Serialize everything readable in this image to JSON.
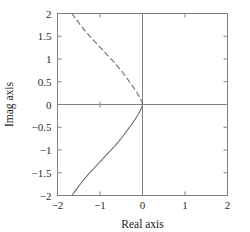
{
  "chart_data": {
    "type": "line",
    "title": "",
    "xlabel": "Real axis",
    "ylabel": "Imag axis",
    "xlim": [
      -2,
      2
    ],
    "ylim": [
      -2,
      2
    ],
    "grid": false,
    "legend": "none",
    "xticks": [
      -2,
      -1,
      0,
      1,
      2
    ],
    "xticklabels": [
      "−2",
      "−1",
      "0",
      "1",
      "2"
    ],
    "yticks": [
      -2,
      -1.5,
      -1,
      -0.5,
      0,
      0.5,
      1,
      1.5,
      2
    ],
    "yticklabels": [
      "−2",
      "−1.5",
      "−1",
      "−0.5",
      "0",
      "0.5",
      "1",
      "1.5",
      "2"
    ],
    "annotations": [
      {
        "name": "real-axis-line",
        "type": "axhline",
        "y": 0,
        "color": "#808080"
      },
      {
        "name": "imag-axis-line",
        "type": "axvline",
        "x": 0,
        "color": "#808080"
      },
      {
        "name": "interior-tick-marker",
        "type": "marker",
        "x": -1.0,
        "y": 0,
        "color": "#808080"
      }
    ],
    "series": [
      {
        "name": "branch-lower-solid",
        "style": "solid",
        "color": "#6e6e6e",
        "linewidth": 1.1,
        "x": [
          -1.66,
          -1.6,
          -1.52,
          -1.44,
          -1.35,
          -1.26,
          -1.16,
          -1.06,
          -0.96,
          -0.86,
          -0.76,
          -0.66,
          -0.57,
          -0.48,
          -0.4,
          -0.33,
          -0.26,
          -0.2,
          -0.15,
          -0.11,
          -0.08,
          -0.05,
          -0.03,
          -0.015,
          -0.005,
          0.0
        ],
        "y": [
          -2.0,
          -1.92,
          -1.82,
          -1.72,
          -1.62,
          -1.52,
          -1.42,
          -1.32,
          -1.22,
          -1.12,
          -1.02,
          -0.92,
          -0.82,
          -0.72,
          -0.62,
          -0.53,
          -0.44,
          -0.36,
          -0.29,
          -0.23,
          -0.18,
          -0.13,
          -0.09,
          -0.055,
          -0.025,
          0.0
        ]
      },
      {
        "name": "branch-upper-dashed",
        "style": "dashed",
        "color": "#6e6e6e",
        "linewidth": 1.1,
        "dasharray": "5,3.5",
        "x": [
          -1.66,
          -1.6,
          -1.52,
          -1.44,
          -1.35,
          -1.26,
          -1.16,
          -1.06,
          -0.96,
          -0.86,
          -0.76,
          -0.66,
          -0.57,
          -0.48,
          -0.4,
          -0.33,
          -0.26,
          -0.2,
          -0.15,
          -0.11,
          -0.08,
          -0.05,
          -0.03,
          -0.015,
          -0.005,
          0.0
        ],
        "y": [
          2.0,
          1.92,
          1.82,
          1.72,
          1.62,
          1.52,
          1.42,
          1.32,
          1.22,
          1.12,
          1.02,
          0.92,
          0.82,
          0.72,
          0.62,
          0.53,
          0.44,
          0.36,
          0.29,
          0.23,
          0.18,
          0.13,
          0.09,
          0.055,
          0.025,
          0.0
        ]
      }
    ]
  },
  "figure": {
    "frame_color": "#808080",
    "tick_color": "#808080",
    "background": "#ffffff"
  }
}
